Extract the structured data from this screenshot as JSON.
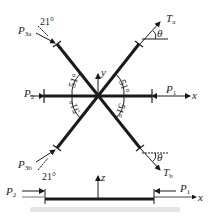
{
  "diagram": {
    "labels": {
      "p3a": "P",
      "p3a_sub": "3a",
      "p3b": "P",
      "p3b_sub": "3b",
      "p2": "P",
      "p2_sub": "2",
      "p1": "P",
      "p1_sub": "1",
      "ta": "T",
      "ta_sub": "a",
      "tb": "T",
      "tb_sub": "b",
      "x_axis": "x",
      "y_axis": "y",
      "z_axis": "z",
      "x_axis_side": "x",
      "z_axis_side": "z",
      "p2_side": "P",
      "p2_side_sub": "2",
      "p1_side": "P",
      "p1_side_sub": "1"
    },
    "angles": {
      "a21_top": "21°",
      "a21_bottom": "21°",
      "a51_ul": "51°",
      "a51_ur": "51°",
      "a51_ll": "51°",
      "a51_lr": "51°",
      "theta_top": "θ",
      "theta_bottom": "θ"
    },
    "colors": {
      "line": "#1a1a1a",
      "thin": "#333333"
    }
  }
}
